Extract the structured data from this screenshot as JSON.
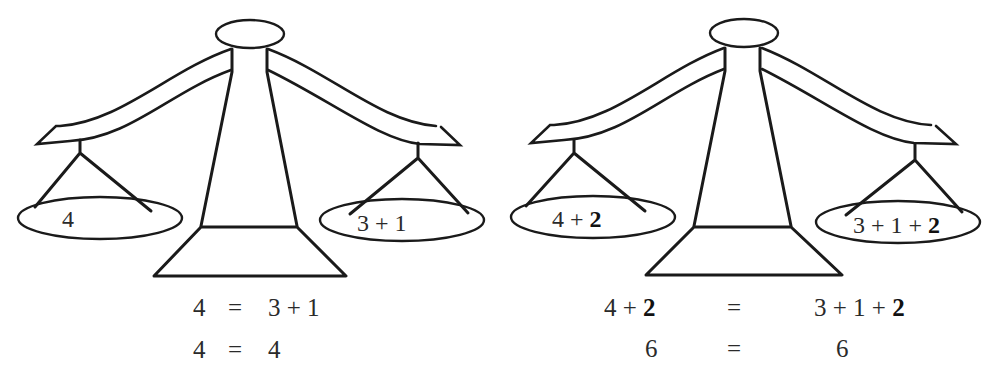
{
  "scales": [
    {
      "id": "original",
      "left_pan": [
        {
          "text": "4",
          "bold": false
        }
      ],
      "right_pan": [
        {
          "text": "3 + 1",
          "bold": false
        }
      ],
      "equations": [
        {
          "left": "4",
          "op": "=",
          "right": "3 + 1"
        },
        {
          "left": "4",
          "op": "=",
          "right": "4"
        }
      ]
    },
    {
      "id": "added",
      "left_pan": [
        {
          "text": "4 + ",
          "bold": false
        },
        {
          "text": "2",
          "bold": true
        }
      ],
      "right_pan": [
        {
          "text": "3 + 1 + ",
          "bold": false
        },
        {
          "text": "2",
          "bold": true
        }
      ],
      "equations": [
        {
          "left_plain": "4 + ",
          "left_bold": "2",
          "op": "=",
          "right_plain": "3 + 1 + ",
          "right_bold": "2"
        },
        {
          "left": "6",
          "op": "=",
          "right": "6"
        }
      ]
    }
  ],
  "colors": {
    "stroke": "#1a1a1a",
    "background": "#ffffff"
  }
}
